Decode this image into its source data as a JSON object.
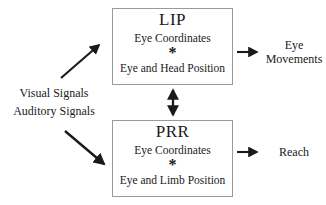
{
  "diagram": {
    "background_color": "#ffffff",
    "line_color": "#1a1a1a",
    "box_border_color": "#9a9a9a"
  },
  "inputs": {
    "labels": [
      {
        "text": "Visual Signals"
      },
      {
        "text": "Auditory Signals"
      }
    ]
  },
  "nodes": [
    {
      "id": "lip",
      "title": "LIP",
      "top_line": "Eye Coordinates",
      "operator": "*",
      "bottom_line": "Eye and Head Position"
    },
    {
      "id": "prr",
      "title": "PRR",
      "top_line": "Eye Coordinates",
      "operator": "*",
      "bottom_line": "Eye and Limb Position"
    }
  ],
  "outputs": [
    {
      "id": "eye-movements",
      "line1": "Eye",
      "line2": "Movements"
    },
    {
      "id": "reach",
      "line1": "Reach",
      "line2": ""
    }
  ],
  "connectors": {
    "input_to_lip": "diagonal-arrow-up-right",
    "input_to_prr": "diagonal-arrow-down-right",
    "lip_to_prr": "vertical-double-headed-arrow",
    "lip_to_output": "horizontal-arrow-right",
    "prr_to_output": "horizontal-arrow-right"
  }
}
